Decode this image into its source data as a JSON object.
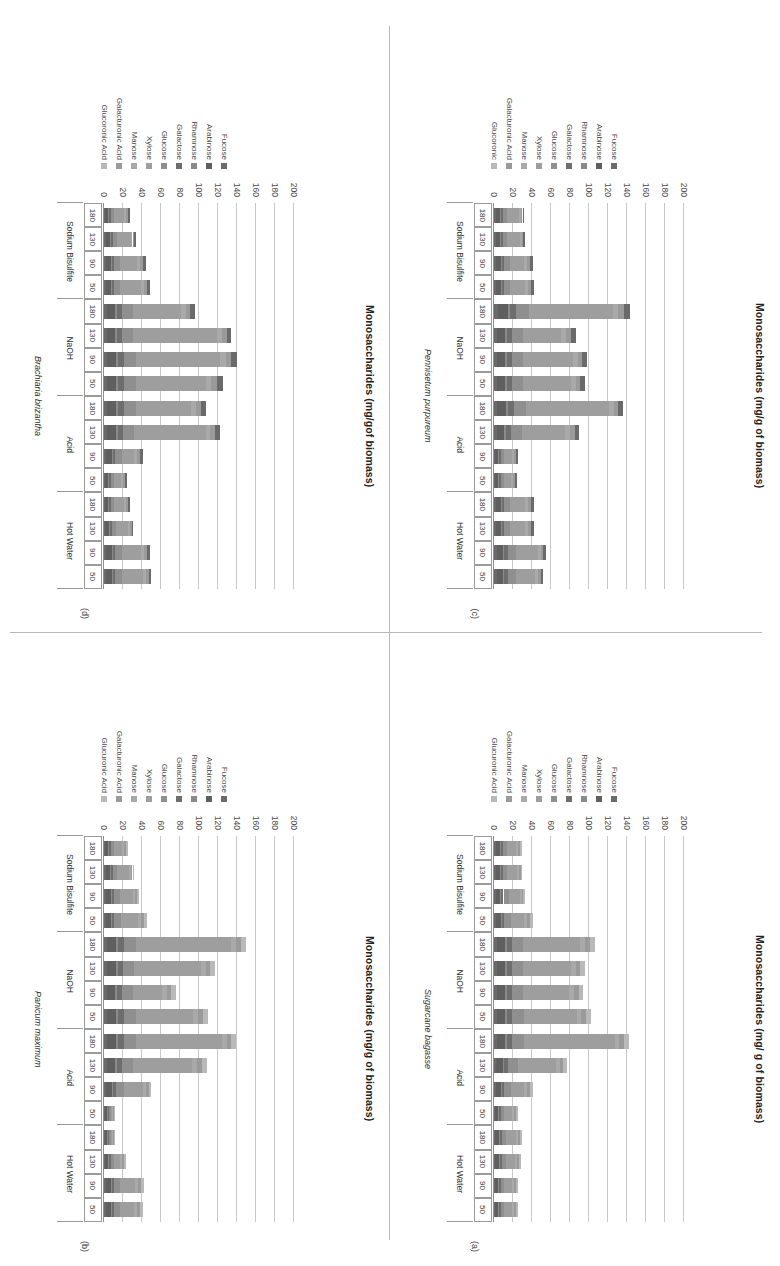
{
  "figure": {
    "panel_count": 4,
    "x_categories": [
      "50",
      "90",
      "130",
      "180"
    ],
    "groups": [
      "Hot Water",
      "Acid",
      "NaOH",
      "Sodium Bisulfite"
    ],
    "y_axis": {
      "label_a": "Monosaccharides (mg/ g of biomass)",
      "label_b": "Monosaccharides (mg/g of biomass)",
      "label_c": "Monosaccharides (mg/g of biomass)",
      "label_d": "Monosaccharides (mg/gof biomass)",
      "ticks": [
        "0",
        "20",
        "40",
        "60",
        "80",
        "100",
        "120",
        "140",
        "160",
        "180",
        "200"
      ],
      "min": 0,
      "max": 200
    },
    "series_colors": {
      "Glucuronic Acid": "#b9b9b9",
      "Galacturonic Acid": "#9a9a9a",
      "Manose": "#a9a9a9",
      "Xylose": "#9e9e9e",
      "Glucose": "#8f8f8f",
      "Galactose": "#6e6e6e",
      "Rhamnose": "#8a8a8a",
      "Arabinose": "#5f5f5f",
      "Fucose": "#6a6a6a"
    }
  },
  "chart_data": [
    {
      "type": "bar",
      "panel": "(a)",
      "title": "Sugarcane bagasse",
      "ylabel": "Monosaccharides (mg/ g of biomass)",
      "xlabel": "",
      "ylim": [
        0,
        200
      ],
      "grid": true,
      "legend_position": "right",
      "orientation": "vertical-stacked",
      "legend": [
        "Glucuronic Acid",
        "Galacturonic Acid",
        "Manose",
        "Xylose",
        "Glucose",
        "Galactose",
        "Rhamnose",
        "Arabinose",
        "Fucose"
      ],
      "groups": [
        "Hot Water",
        "Acid",
        "NaOH",
        "Sodium Bisulfite"
      ],
      "categories": [
        "50",
        "90",
        "130",
        "180",
        "50",
        "90",
        "130",
        "180",
        "50",
        "90",
        "130",
        "180",
        "50",
        "90",
        "130",
        "180"
      ],
      "series": [
        {
          "name": "Fucose",
          "values": [
            1,
            1,
            1,
            1,
            1,
            2,
            2,
            3,
            3,
            3,
            3,
            3,
            2,
            2,
            2,
            2
          ]
        },
        {
          "name": "Arabinose",
          "values": [
            3,
            3,
            4,
            4,
            3,
            5,
            7,
            9,
            9,
            9,
            9,
            9,
            5,
            4,
            4,
            4
          ]
        },
        {
          "name": "Rhamnose",
          "values": [
            1,
            1,
            1,
            1,
            1,
            1,
            2,
            2,
            2,
            2,
            2,
            2,
            1,
            1,
            1,
            1
          ]
        },
        {
          "name": "Galactose",
          "values": [
            2,
            2,
            2,
            2,
            2,
            3,
            4,
            5,
            5,
            5,
            5,
            5,
            3,
            3,
            2,
            2
          ]
        },
        {
          "name": "Glucose",
          "values": [
            4,
            4,
            5,
            5,
            4,
            7,
            10,
            13,
            13,
            12,
            12,
            12,
            7,
            6,
            5,
            5
          ]
        },
        {
          "name": "Xylose",
          "values": [
            8,
            8,
            9,
            10,
            8,
            14,
            40,
            95,
            55,
            48,
            50,
            60,
            14,
            11,
            10,
            9
          ]
        },
        {
          "name": "Manose",
          "values": [
            2,
            2,
            2,
            2,
            2,
            3,
            4,
            5,
            5,
            5,
            5,
            5,
            3,
            2,
            2,
            2
          ]
        },
        {
          "name": "Galacturonic Acid",
          "values": [
            2,
            2,
            2,
            2,
            2,
            3,
            4,
            5,
            5,
            5,
            5,
            5,
            3,
            2,
            2,
            2
          ]
        },
        {
          "name": "Glucuronic Acid",
          "values": [
            2,
            2,
            2,
            2,
            2,
            3,
            4,
            5,
            5,
            5,
            5,
            5,
            3,
            2,
            2,
            2
          ]
        }
      ],
      "totals": [
        25,
        25,
        28,
        29,
        25,
        41,
        78,
        139,
        98,
        94,
        96,
        104,
        41,
        33,
        30,
        28
      ]
    },
    {
      "type": "bar",
      "panel": "(b)",
      "title": "Panicum maximum",
      "ylabel": "Monosaccharides (mg/g of biomass)",
      "xlabel": "",
      "ylim": [
        0,
        200
      ],
      "grid": true,
      "legend_position": "right",
      "orientation": "vertical-stacked",
      "legend": [
        "Glucuronic Acid",
        "Galacturonic Acid",
        "Manose",
        "Xylose",
        "Glucose",
        "Galactose",
        "Rhamnose",
        "Arabinose",
        "Fucose"
      ],
      "groups": [
        "Hot Water",
        "Acid",
        "NaOH",
        "Sodium Bisulfite"
      ],
      "categories": [
        "50",
        "90",
        "130",
        "180",
        "50",
        "90",
        "130",
        "180",
        "50",
        "90",
        "130",
        "180",
        "50",
        "90",
        "130",
        "180"
      ],
      "series": [
        {
          "name": "Fucose",
          "values": [
            2,
            2,
            1,
            1,
            1,
            2,
            3,
            3,
            3,
            3,
            3,
            3,
            2,
            2,
            2,
            1
          ]
        },
        {
          "name": "Arabinose",
          "values": [
            5,
            5,
            3,
            2,
            2,
            6,
            9,
            10,
            10,
            9,
            10,
            10,
            5,
            5,
            4,
            3
          ]
        },
        {
          "name": "Rhamnose",
          "values": [
            1,
            1,
            1,
            1,
            1,
            1,
            2,
            2,
            2,
            2,
            2,
            2,
            1,
            1,
            1,
            1
          ]
        },
        {
          "name": "Galactose",
          "values": [
            3,
            3,
            2,
            1,
            1,
            4,
            5,
            6,
            6,
            5,
            5,
            6,
            3,
            3,
            2,
            2
          ]
        },
        {
          "name": "Glucose",
          "values": [
            6,
            6,
            4,
            2,
            2,
            8,
            12,
            13,
            13,
            12,
            12,
            13,
            7,
            6,
            5,
            4
          ]
        },
        {
          "name": "Xylose",
          "values": [
            15,
            16,
            6,
            2,
            2,
            20,
            62,
            90,
            60,
            30,
            70,
            100,
            18,
            14,
            12,
            8
          ]
        },
        {
          "name": "Manose",
          "values": [
            3,
            3,
            2,
            1,
            1,
            3,
            5,
            5,
            5,
            5,
            5,
            5,
            3,
            2,
            2,
            2
          ]
        },
        {
          "name": "Galacturonic Acid",
          "values": [
            3,
            3,
            2,
            1,
            1,
            3,
            5,
            5,
            5,
            5,
            5,
            5,
            3,
            2,
            2,
            2
          ]
        },
        {
          "name": "Glucuronic Acid",
          "values": [
            3,
            3,
            2,
            1,
            1,
            3,
            5,
            5,
            5,
            5,
            5,
            5,
            3,
            2,
            2,
            2
          ]
        }
      ],
      "totals": [
        41,
        42,
        23,
        12,
        12,
        50,
        108,
        135,
        109,
        76,
        117,
        149,
        45,
        37,
        32,
        25
      ]
    },
    {
      "type": "bar",
      "panel": "(c)",
      "title": "Pennisetum purpureum",
      "ylabel": "Monosaccharides (mg/g of biomass)",
      "xlabel": "",
      "ylim": [
        0,
        200
      ],
      "grid": true,
      "legend_position": "right",
      "orientation": "vertical-stacked",
      "legend": [
        "Glucoronic",
        "Galacturonic Acid",
        "Manose",
        "Xylose",
        "Glucose",
        "Galactose",
        "Rhamnose",
        "Arabinose",
        "Fucose"
      ],
      "groups": [
        "Hot Water",
        "Acid",
        "NaOH",
        "Sodium Bisulfite"
      ],
      "categories": [
        "50",
        "90",
        "130",
        "180",
        "50",
        "90",
        "130",
        "180",
        "50",
        "90",
        "130",
        "180",
        "50",
        "90",
        "130",
        "180"
      ],
      "series": [
        {
          "name": "Fucose",
          "values": [
            3,
            3,
            2,
            2,
            1,
            1,
            3,
            3,
            3,
            3,
            3,
            4,
            2,
            2,
            2,
            2
          ]
        },
        {
          "name": "Arabinose",
          "values": [
            7,
            7,
            5,
            5,
            3,
            3,
            8,
            10,
            9,
            9,
            9,
            11,
            5,
            5,
            4,
            4
          ]
        },
        {
          "name": "Rhamnose",
          "values": [
            1,
            1,
            1,
            1,
            1,
            1,
            2,
            2,
            2,
            2,
            2,
            2,
            1,
            1,
            1,
            1
          ]
        },
        {
          "name": "Galactose",
          "values": [
            4,
            4,
            3,
            3,
            2,
            2,
            5,
            6,
            5,
            5,
            5,
            6,
            3,
            3,
            2,
            2
          ]
        },
        {
          "name": "Glucose",
          "values": [
            8,
            8,
            6,
            6,
            4,
            4,
            11,
            13,
            12,
            12,
            12,
            14,
            6,
            6,
            5,
            5
          ]
        },
        {
          "name": "Xylose",
          "values": [
            20,
            23,
            16,
            16,
            7,
            8,
            46,
            87,
            50,
            52,
            40,
            88,
            16,
            15,
            13,
            12
          ]
        },
        {
          "name": "Manose",
          "values": [
            3,
            3,
            3,
            3,
            2,
            2,
            5,
            5,
            5,
            5,
            5,
            6,
            3,
            3,
            2,
            2
          ]
        },
        {
          "name": "Galacturonic Acid",
          "values": [
            3,
            3,
            3,
            3,
            2,
            2,
            5,
            5,
            5,
            5,
            5,
            6,
            3,
            3,
            2,
            2
          ]
        },
        {
          "name": "Glucoronic",
          "values": [
            3,
            3,
            3,
            3,
            2,
            2,
            5,
            5,
            5,
            5,
            5,
            6,
            3,
            3,
            2,
            2
          ]
        }
      ],
      "totals": [
        52,
        55,
        42,
        42,
        24,
        25,
        90,
        136,
        96,
        98,
        86,
        143,
        42,
        41,
        33,
        32
      ]
    },
    {
      "type": "bar",
      "panel": "(d)",
      "title": "Brachiaria brizantha",
      "ylabel": "Monosaccharides (mg/gof biomass)",
      "xlabel": "",
      "ylim": [
        0,
        200
      ],
      "grid": true,
      "legend_position": "right",
      "orientation": "vertical-stacked",
      "legend": [
        "Glucoronic Acid",
        "Galacturonic Acid",
        "Manose",
        "Xylose",
        "Glucose",
        "Galactose",
        "Rhamnose",
        "Arabinose",
        "Fucose"
      ],
      "groups": [
        "Hot Water",
        "Acid",
        "NaOH",
        "Sodium Bisulfite"
      ],
      "categories": [
        "50",
        "90",
        "130",
        "180",
        "50",
        "90",
        "130",
        "180",
        "50",
        "90",
        "130",
        "180",
        "50",
        "90",
        "130",
        "180"
      ],
      "series": [
        {
          "name": "Fucose",
          "values": [
            2,
            2,
            1,
            1,
            1,
            2,
            3,
            3,
            3,
            3,
            3,
            3,
            2,
            2,
            2,
            1
          ]
        },
        {
          "name": "Arabinose",
          "values": [
            6,
            6,
            4,
            3,
            3,
            6,
            10,
            10,
            10,
            10,
            9,
            9,
            5,
            5,
            4,
            3
          ]
        },
        {
          "name": "Rhamnose",
          "values": [
            1,
            1,
            1,
            1,
            1,
            1,
            2,
            2,
            2,
            2,
            2,
            2,
            1,
            1,
            1,
            1
          ]
        },
        {
          "name": "Galactose",
          "values": [
            3,
            3,
            2,
            2,
            2,
            3,
            5,
            6,
            6,
            6,
            5,
            5,
            3,
            3,
            2,
            2
          ]
        },
        {
          "name": "Glucose",
          "values": [
            7,
            7,
            5,
            4,
            4,
            7,
            12,
            13,
            13,
            13,
            12,
            12,
            6,
            6,
            5,
            4
          ]
        },
        {
          "name": "Xylose",
          "values": [
            22,
            20,
            12,
            10,
            7,
            13,
            75,
            58,
            73,
            88,
            88,
            50,
            22,
            18,
            14,
            10
          ]
        },
        {
          "name": "Manose",
          "values": [
            3,
            3,
            2,
            2,
            2,
            3,
            5,
            5,
            6,
            6,
            5,
            5,
            3,
            3,
            2,
            2
          ]
        },
        {
          "name": "Galacturonic Acid",
          "values": [
            3,
            3,
            2,
            2,
            2,
            3,
            5,
            5,
            6,
            6,
            5,
            5,
            3,
            3,
            2,
            2
          ]
        },
        {
          "name": "Glucoronic Acid",
          "values": [
            3,
            3,
            2,
            2,
            2,
            3,
            5,
            5,
            6,
            6,
            5,
            5,
            3,
            3,
            2,
            2
          ]
        }
      ],
      "totals": [
        50,
        48,
        31,
        27,
        24,
        41,
        122,
        107,
        125,
        140,
        134,
        96,
        48,
        44,
        34,
        27
      ]
    }
  ]
}
